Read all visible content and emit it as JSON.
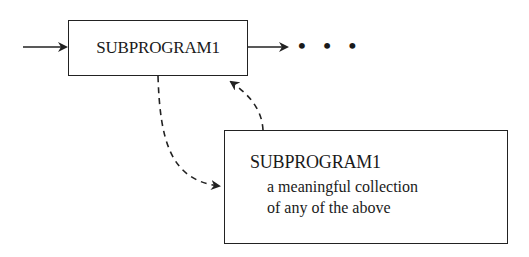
{
  "diagram": {
    "top_box": {
      "label": "SUBPROGRAM1"
    },
    "continuation": "• • •",
    "bottom_box": {
      "title": "SUBPROGRAM1",
      "description_line1": "a meaningful collection",
      "description_line2": "of any of the above"
    },
    "connectors": [
      {
        "from": "input",
        "to": "top_box",
        "style": "solid-arrow"
      },
      {
        "from": "top_box",
        "to": "continuation",
        "style": "solid-arrow"
      },
      {
        "from": "top_box",
        "to": "bottom_box",
        "style": "dashed-curved-arrow"
      },
      {
        "from": "bottom_box",
        "to": "top_box",
        "style": "dashed-curved-arrow"
      }
    ],
    "colors": {
      "stroke": "#222222",
      "background": "#ffffff"
    }
  }
}
